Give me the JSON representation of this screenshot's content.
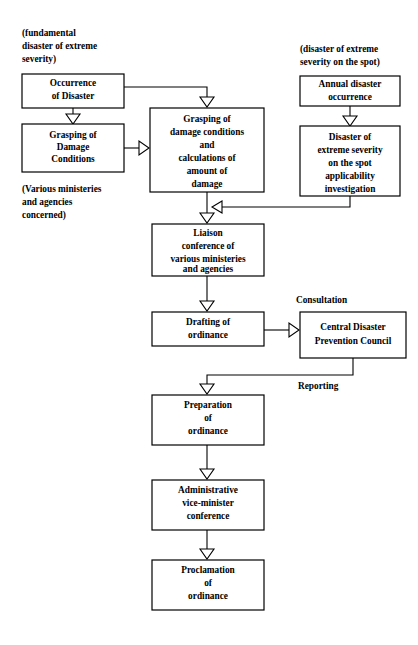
{
  "diagram": {
    "background_color": "#ffffff",
    "line_color": "#000000",
    "boxes": [
      {
        "id": "occurrence-of-disaster",
        "name": "box-occurrence-of-disaster",
        "lines": [
          "Occurrence",
          "of Disaster"
        ],
        "x": 22,
        "y": 74,
        "w": 102,
        "h": 34
      },
      {
        "id": "grasping-of-damage-conditions",
        "name": "box-grasping-of-damage-conditions",
        "lines": [
          "Grasping of",
          "Damage",
          "Conditions"
        ],
        "x": 22,
        "y": 124,
        "w": 102,
        "h": 48
      },
      {
        "id": "grasping-and-calculations",
        "name": "box-grasping-and-calculations",
        "lines": [
          "Grasping of",
          "damage conditions",
          "and",
          "calculations of",
          "amount of",
          "damage"
        ],
        "x": 150,
        "y": 108,
        "w": 114,
        "h": 84
      },
      {
        "id": "annual-disaster-occurrence",
        "name": "box-annual-disaster-occurrence",
        "lines": [
          "Annual disaster",
          "occurrence"
        ],
        "x": 300,
        "y": 76,
        "w": 100,
        "h": 30
      },
      {
        "id": "disaster-extreme-severity-investigation",
        "name": "box-disaster-extreme-severity-investigation",
        "lines": [
          "Disaster of",
          "extreme severity",
          "on the spot",
          "applicability",
          "investigation"
        ],
        "x": 300,
        "y": 126,
        "w": 100,
        "h": 70
      },
      {
        "id": "liaison-conference",
        "name": "box-liaison-conference",
        "lines": [
          "Liaison",
          "conference of",
          "various ministeries",
          "and agencies"
        ],
        "x": 152,
        "y": 224,
        "w": 112,
        "h": 52
      },
      {
        "id": "drafting-of-ordinance",
        "name": "box-drafting-of-ordinance",
        "lines": [
          "Drafting of",
          "ordinance"
        ],
        "x": 152,
        "y": 312,
        "w": 112,
        "h": 34
      },
      {
        "id": "central-disaster-prevention-council",
        "name": "box-central-disaster-prevention-council",
        "lines": [
          "Central Disaster",
          "Prevention Council"
        ],
        "x": 300,
        "y": 312,
        "w": 106,
        "h": 46
      },
      {
        "id": "preparation-of-ordinance",
        "name": "box-preparation-of-ordinance",
        "lines": [
          "Preparation",
          "of",
          "ordinance"
        ],
        "x": 152,
        "y": 395,
        "w": 112,
        "h": 50
      },
      {
        "id": "administrative-vice-minister-conference",
        "name": "box-administrative-vice-minister-conference",
        "lines": [
          "Administrative",
          "vice-minister",
          "conference"
        ],
        "x": 152,
        "y": 480,
        "w": 112,
        "h": 50
      },
      {
        "id": "proclamation-of-ordinance",
        "name": "box-proclamation-of-ordinance",
        "lines": [
          "Proclamation",
          "of",
          "ordinance"
        ],
        "x": 152,
        "y": 560,
        "w": 112,
        "h": 50
      }
    ],
    "notes": [
      {
        "id": "note-fundamental-disaster",
        "name": "note-fundamental-disaster-of-extreme-severity",
        "lines": [
          "(fundamental",
          "disaster of extreme",
          "severity)"
        ],
        "x": 22,
        "y": 32
      },
      {
        "id": "note-various-ministries",
        "name": "note-various-ministries-and-agencies-concerned",
        "lines": [
          "(Various ministeries",
          "and agencies",
          "concerned)"
        ],
        "x": 22,
        "y": 188
      },
      {
        "id": "note-disaster-on-the-spot",
        "name": "note-disaster-of-extreme-severity-on-the-spot",
        "lines": [
          "(disaster of extreme",
          "severity on the spot)"
        ],
        "x": 300,
        "y": 48
      }
    ],
    "edge_labels": [
      {
        "id": "label-consultation",
        "name": "edge-label-consultation",
        "text": "Consultation",
        "x": 296,
        "y": 300
      },
      {
        "id": "label-reporting",
        "name": "edge-label-reporting",
        "text": "Reporting",
        "x": 298,
        "y": 386
      }
    ]
  }
}
